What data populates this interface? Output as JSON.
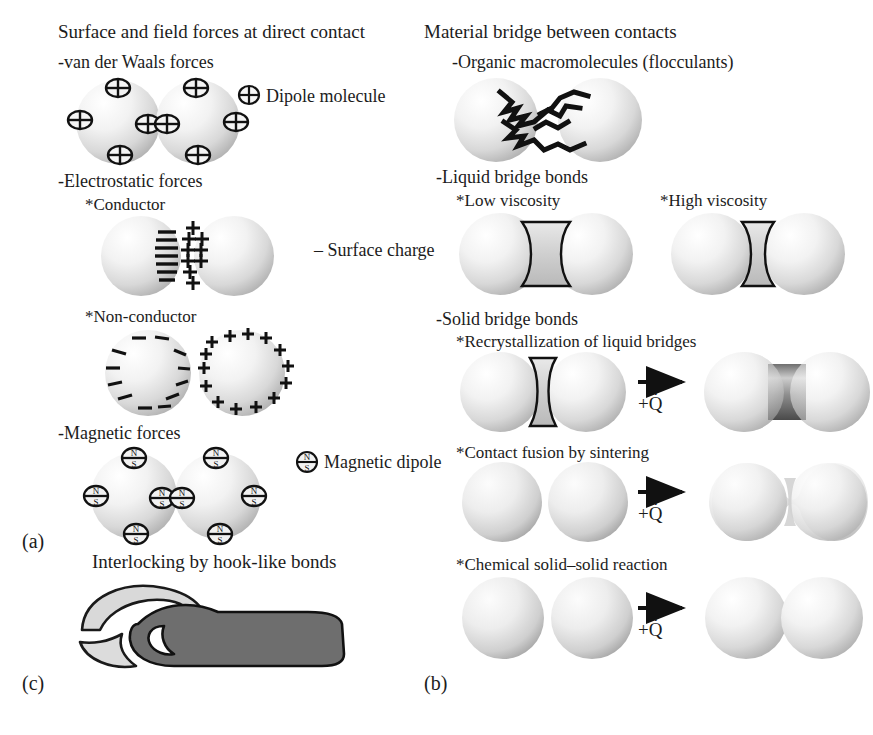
{
  "figure": {
    "type": "diagram",
    "background": "#ffffff",
    "ink": "#1c1c1c"
  },
  "columns": {
    "left": {
      "header": "Surface and field forces at direct contact",
      "panel_label": "(a)",
      "sections": [
        {
          "heading": "-van der Waals forces",
          "legend": "Dipole molecule",
          "legend_icon": "dipole-molecule-icon",
          "illustration": "two-spheres-with-dipoles"
        },
        {
          "heading": "-Electrostatic forces",
          "items": [
            {
              "subheading": "*Conductor",
              "legend": "– Surface charge",
              "illustration": "two-spheres-conductor-charges",
              "left_sign": "–",
              "right_sign": "+"
            },
            {
              "subheading": "*Non-conductor",
              "illustration": "two-spheres-nonconductor-charges",
              "left_sign": "–",
              "right_sign": "+"
            }
          ]
        },
        {
          "heading": "-Magnetic forces",
          "legend": "Magnetic dipole",
          "legend_icon": "magnetic-dipole-icon",
          "illustration": "two-spheres-with-magnetic-dipoles",
          "pole_north": "N",
          "pole_south": "S"
        }
      ]
    },
    "right": {
      "header": "Material bridge between contacts",
      "panel_label": "(b)",
      "sections": [
        {
          "heading": "-Organic macromolecules (flocculants)",
          "illustration": "two-spheres-polymer-zigzag-bridge"
        },
        {
          "heading": "-Liquid bridge bonds",
          "items": [
            {
              "subheading": "*Low viscosity",
              "illustration": "two-spheres-wide-liquid-bridge"
            },
            {
              "subheading": "*High viscosity",
              "illustration": "two-spheres-narrow-liquid-bridge"
            }
          ]
        },
        {
          "heading": "-Solid bridge bonds",
          "items": [
            {
              "subheading": "*Recrystallization of liquid bridges",
              "before": "two-spheres-liquid-bridge",
              "after": "two-spheres-solid-cylindrical-bridge",
              "arrow_label": "+Q̇"
            },
            {
              "subheading": "*Contact fusion by sintering",
              "before": "two-spheres-touching",
              "after": "two-spheres-sintered-neck",
              "arrow_label": "+Q̇"
            },
            {
              "subheading": "*Chemical solid–solid reaction",
              "before": "two-spheres-separated",
              "after": "two-spheres-fused-tangent",
              "arrow_label": "+Q̇"
            }
          ]
        }
      ]
    },
    "bottom_left": {
      "panel_label": "(c)",
      "heading": "Interlocking by hook-like bonds",
      "illustration": "two-interlocking-hooks",
      "hook_light_color": "#d4d4d4",
      "hook_dark_color": "#6e6e6e"
    }
  }
}
